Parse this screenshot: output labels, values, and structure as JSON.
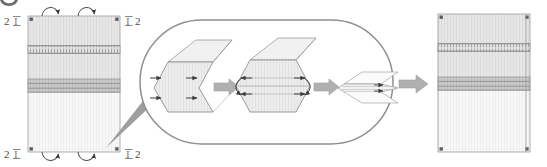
{
  "figure": {
    "type": "technical-diagram",
    "background": "#ffffff",
    "width": 547,
    "height": 167
  },
  "palette": {
    "outline": "#8a8a8a",
    "outline_dark": "#5d5d5d",
    "panel_fill_upper": "#e3e3e3",
    "panel_fill_lower": "#f4f4f4",
    "band_thin": "#cfcfcf",
    "band_thick": "#c2c2c2",
    "band_line": "#9a9a9a",
    "arrow_gray": "#a8a8a8",
    "wedge_gray": "#9e9e9e",
    "arrow_dark": "#3c3c3c",
    "oval_stroke": "#8f8f8f",
    "hatch": "#d6d6d6",
    "corner_mark": "#6b6b6b"
  },
  "left_panel": {
    "name": "initial-deployed-panel",
    "labels": {
      "top_left": "2",
      "top_left_bar": "I",
      "top_right_bar": "I",
      "top_right": "2",
      "bottom_left": "2",
      "bottom_left_bar": "I",
      "bottom_right_bar": "I",
      "bottom_right": "2"
    },
    "bands": [
      {
        "id": "thin-hatched-band",
        "y": 46,
        "height": 7,
        "style": "dashed-hatch"
      },
      {
        "id": "thick-gray-band",
        "y": 80,
        "height": 12,
        "style": "solid-striped"
      }
    ],
    "fold_arrows_top": 2,
    "fold_arrows_bottom": 2,
    "corner_marks": 4
  },
  "detail_callout": {
    "name": "magnified-detail-oval",
    "shape": "stadium-oval",
    "pointer": "wedge-from-left-panel",
    "steps": [
      {
        "id": "step-1-open-hexagon",
        "state": "open",
        "arrow_marks": 4
      },
      {
        "id": "step-2-partially-folded",
        "state": "folding",
        "arrow_marks": 4,
        "rotation_arrows": 2
      },
      {
        "id": "step-3-collapsed-flat",
        "state": "collapsed",
        "arrow_marks": 2
      }
    ],
    "transition_arrows": 2
  },
  "result_arrow": {
    "name": "result-transition-arrow",
    "direction": "right"
  },
  "right_panel": {
    "name": "final-stowed-panel",
    "bands": [
      {
        "id": "thin-hatched-band",
        "y": 46,
        "height": 7,
        "style": "dashed-hatch"
      },
      {
        "id": "thick-gray-band",
        "y": 80,
        "height": 12,
        "style": "solid-striped"
      }
    ],
    "corner_marks": 4
  },
  "top_left_glyph": {
    "name": "clipped-circle-marker",
    "description": "partially cropped dark ellipse at extreme top-left"
  }
}
